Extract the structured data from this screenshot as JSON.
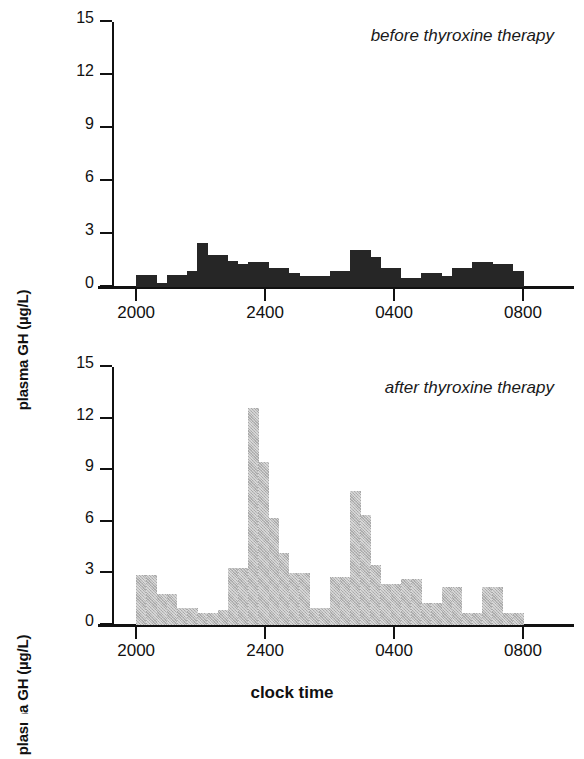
{
  "figure": {
    "xlabel": "clock time",
    "ylabel": "plasma GH (µg/L)"
  },
  "panels": [
    {
      "id": "before",
      "annotation": "before thyroxine therapy",
      "series_color": "#262626"
    },
    {
      "id": "after",
      "annotation": "after thyroxine therapy",
      "series_color": "#b9b9b9"
    }
  ],
  "axes": {
    "y_ticks": [
      "0",
      "3",
      "6",
      "9",
      "12",
      "15"
    ],
    "y_tick_values": [
      0,
      3,
      6,
      9,
      12,
      15
    ],
    "ylim": [
      0,
      15
    ],
    "x_ticks": [
      "2000",
      "2400",
      "0400",
      "0800"
    ],
    "x_tick_values": [
      2000,
      2400,
      400,
      800
    ],
    "xlim": [
      2000,
      800
    ]
  },
  "chart_data": [
    {
      "type": "bar",
      "title": "before thyroxine therapy",
      "xlabel": "clock time",
      "ylabel": "plasma GH (µg/L)",
      "ylim": [
        0,
        15
      ],
      "grid": false,
      "legend": "none",
      "bar_color": "#262626",
      "bar_interval_minutes": 20,
      "x_start": "2000",
      "x_end": "0800",
      "categories": [
        "2000",
        "2020",
        "2040",
        "2100",
        "2120",
        "2140",
        "2200",
        "2220",
        "2240",
        "2300",
        "2320",
        "2340",
        "2400",
        "0020",
        "0040",
        "0100",
        "0120",
        "0140",
        "0200",
        "0220",
        "0240",
        "0300",
        "0320",
        "0340",
        "0400",
        "0420",
        "0440",
        "0500",
        "0520",
        "0540",
        "0600",
        "0620",
        "0640",
        "0700",
        "0720",
        "0740"
      ],
      "values": [
        0.7,
        0.7,
        0.2,
        0.7,
        0.7,
        0.9,
        2.5,
        1.8,
        1.8,
        1.5,
        1.3,
        1.4,
        1.4,
        1.1,
        1.1,
        0.8,
        0.6,
        0.6,
        0.6,
        0.9,
        0.9,
        2.1,
        2.1,
        1.7,
        1.1,
        1.1,
        0.5,
        0.5,
        0.8,
        0.8,
        0.6,
        1.1,
        1.1,
        1.4,
        1.4,
        1.3,
        1.3,
        0.9
      ]
    },
    {
      "type": "bar",
      "title": "after thyroxine therapy",
      "xlabel": "clock time",
      "ylabel": "plasma GH (µg/L)",
      "ylim": [
        0,
        15
      ],
      "grid": false,
      "legend": "none",
      "bar_color": "#b9b9b9",
      "bar_interval_minutes": 20,
      "x_start": "2000",
      "x_end": "0800",
      "categories": [
        "2000",
        "2020",
        "2040",
        "2100",
        "2120",
        "2140",
        "2200",
        "2220",
        "2240",
        "2300",
        "2320",
        "2340",
        "2400",
        "0020",
        "0040",
        "0100",
        "0120",
        "0140",
        "0200",
        "0220",
        "0240",
        "0300",
        "0320",
        "0340",
        "0400",
        "0420",
        "0440",
        "0500",
        "0520",
        "0540",
        "0600",
        "0620",
        "0640",
        "0700",
        "0720",
        "0740"
      ],
      "values": [
        2.9,
        2.9,
        1.8,
        1.8,
        1.0,
        1.0,
        0.7,
        0.7,
        0.9,
        3.3,
        3.3,
        12.6,
        9.5,
        6.2,
        4.2,
        3.0,
        3.0,
        1.0,
        1.0,
        2.8,
        2.8,
        7.8,
        6.4,
        3.5,
        2.4,
        2.4,
        2.7,
        2.7,
        1.3,
        1.3,
        2.2,
        2.2,
        0.7,
        0.7,
        2.2,
        2.2,
        0.7,
        0.7
      ]
    }
  ]
}
